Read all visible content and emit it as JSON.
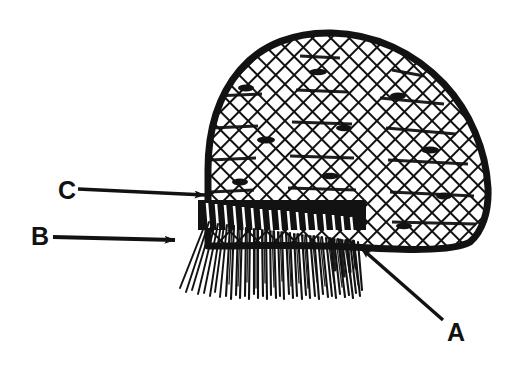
{
  "figure": {
    "caption": "",
    "background_color": "#ffffff",
    "ink_color": "#121212",
    "width": 515,
    "height": 381
  },
  "labels": [
    {
      "id": "A",
      "text": "A",
      "x": 447,
      "y": 341,
      "points_to": "rim-band-right-end",
      "arrow": {
        "from_x": 443,
        "from_y": 320,
        "to_x": 356,
        "to_y": 244,
        "head": "to",
        "style": "straight-diagonal"
      }
    },
    {
      "id": "B",
      "text": "B",
      "x": 31,
      "y": 245,
      "points_to": "fringe-strands",
      "arrow": {
        "from_x": 53,
        "from_y": 237,
        "to_x": 181,
        "to_y": 240,
        "head": "to",
        "style": "straight-horizontal"
      }
    },
    {
      "id": "C",
      "text": "C",
      "x": 58,
      "y": 199,
      "points_to": "netted-dome-lower-left-edge",
      "arrow": {
        "from_x": 78,
        "from_y": 189,
        "to_x": 211,
        "to_y": 195,
        "head": "to",
        "style": "straight-horizontal"
      }
    }
  ],
  "parts": {
    "dome": {
      "name": "netted-dome",
      "description": "Dome-shaped woven cap body with diagonal crosshatch lattice mesh",
      "outline_stroke_px": 7,
      "mesh_stroke_px": 2.6,
      "mesh_spacing_px": 13,
      "apex_y": 33,
      "left_x": 207,
      "right_x": 489,
      "base_y": 246
    },
    "rim": {
      "name": "rim-band",
      "description": "Dense dark woven binding band at the base of the dome",
      "top_y": 203,
      "bottom_y": 228,
      "left_x": 203,
      "right_x": 360
    },
    "fringe": {
      "name": "fringe-strands",
      "description": "Bundle of fine hanging strands below the rim band",
      "strand_count": 64,
      "top_y": 222,
      "bottom_y": 300,
      "left_x": 178,
      "right_x": 362
    }
  }
}
